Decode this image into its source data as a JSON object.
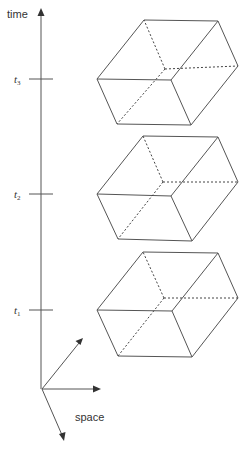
{
  "diagram": {
    "axis_label_time": "time",
    "axis_label_space": "space",
    "ticks": [
      {
        "label": "t",
        "subscript": "3",
        "y": 79
      },
      {
        "label": "t",
        "subscript": "2",
        "y": 194
      },
      {
        "label": "t",
        "subscript": "1",
        "y": 310
      }
    ],
    "boxes": [
      {
        "name": "box-at-t3"
      },
      {
        "name": "box-at-t2"
      },
      {
        "name": "box-at-t1"
      }
    ],
    "colors": {
      "line": "#555555",
      "text": "#333333",
      "background": "#ffffff"
    }
  }
}
